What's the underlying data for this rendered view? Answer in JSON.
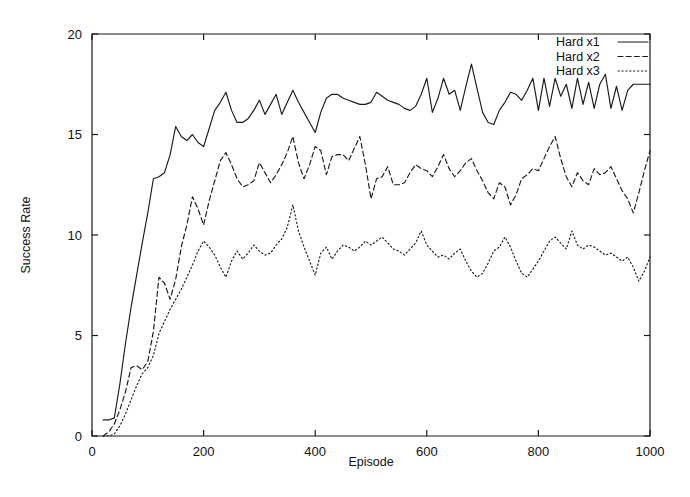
{
  "chart_data": {
    "type": "line",
    "title": "",
    "subtitle": "",
    "xlabel": "Episode",
    "ylabel": "Success Rate",
    "xlim": [
      0,
      1000
    ],
    "ylim": [
      0,
      20
    ],
    "xticks": [
      0,
      200,
      400,
      600,
      800,
      1000
    ],
    "yticks": [
      0,
      5,
      10,
      15,
      20
    ],
    "xtick_labels": [
      "0",
      "200",
      "400",
      "600",
      "800",
      "1000"
    ],
    "ytick_labels": [
      "0",
      "5",
      "10",
      "15",
      "20"
    ],
    "grid": false,
    "legend_position": "top-right",
    "legend_entries": [
      "Hard x1",
      "Hard x2",
      "Hard x3"
    ],
    "x": [
      20,
      30,
      40,
      50,
      60,
      70,
      80,
      90,
      100,
      110,
      120,
      130,
      140,
      150,
      160,
      170,
      180,
      190,
      200,
      210,
      220,
      230,
      240,
      250,
      260,
      270,
      280,
      290,
      300,
      310,
      320,
      330,
      340,
      350,
      360,
      370,
      380,
      390,
      400,
      410,
      420,
      430,
      440,
      450,
      460,
      470,
      480,
      490,
      500,
      510,
      520,
      530,
      540,
      550,
      560,
      570,
      580,
      590,
      600,
      610,
      620,
      630,
      640,
      650,
      660,
      670,
      680,
      690,
      700,
      710,
      720,
      730,
      740,
      750,
      760,
      770,
      780,
      790,
      800,
      810,
      820,
      830,
      840,
      850,
      860,
      870,
      880,
      890,
      900,
      910,
      920,
      930,
      940,
      950,
      960,
      970,
      980,
      990,
      1000
    ],
    "series": [
      {
        "name": "Hard x1",
        "style": "solid",
        "color": "#1a1a1a",
        "values": [
          0.8,
          0.8,
          0.9,
          2.6,
          4.6,
          6.4,
          8.0,
          9.6,
          11.1,
          12.8,
          12.9,
          13.1,
          14.0,
          15.4,
          14.9,
          14.7,
          15.0,
          14.6,
          14.4,
          15.3,
          16.2,
          16.6,
          17.1,
          16.2,
          15.6,
          15.6,
          15.8,
          16.2,
          16.7,
          16.0,
          16.5,
          17.0,
          16.0,
          16.6,
          17.2,
          16.6,
          16.1,
          15.6,
          15.1,
          16.1,
          16.8,
          17.0,
          17.0,
          16.8,
          16.7,
          16.6,
          16.5,
          16.5,
          16.6,
          17.1,
          16.9,
          16.7,
          16.6,
          16.5,
          16.3,
          16.2,
          16.4,
          17.0,
          17.8,
          16.1,
          16.8,
          17.8,
          17.0,
          17.2,
          16.2,
          17.4,
          18.5,
          17.3,
          16.1,
          15.6,
          15.5,
          16.2,
          16.6,
          17.1,
          17.0,
          16.7,
          17.2,
          17.8,
          16.2,
          17.8,
          16.4,
          17.8,
          16.9,
          17.5,
          16.3,
          17.8,
          16.5,
          17.6,
          16.3,
          17.5,
          18.0,
          16.3,
          17.4,
          16.2,
          17.2,
          17.5,
          17.5,
          17.5,
          17.5
        ]
      },
      {
        "name": "Hard x2",
        "style": "dashed",
        "color": "#1a1a1a",
        "values": [
          0.0,
          0.2,
          0.6,
          1.3,
          2.2,
          3.4,
          3.5,
          3.3,
          3.7,
          5.2,
          7.9,
          7.6,
          6.8,
          7.8,
          9.4,
          10.5,
          11.9,
          11.3,
          10.5,
          11.7,
          12.7,
          13.7,
          14.1,
          13.5,
          12.8,
          12.4,
          12.5,
          12.7,
          13.6,
          13.1,
          12.6,
          13.0,
          13.5,
          14.1,
          14.9,
          13.6,
          12.8,
          13.5,
          14.4,
          14.2,
          13.0,
          13.9,
          14.0,
          14.0,
          13.7,
          14.3,
          14.9,
          13.5,
          11.8,
          12.8,
          12.9,
          13.4,
          12.5,
          12.5,
          12.6,
          13.1,
          13.5,
          13.3,
          13.2,
          12.9,
          13.4,
          14.0,
          13.3,
          12.9,
          13.2,
          13.6,
          13.8,
          13.2,
          12.7,
          12.1,
          11.8,
          12.6,
          12.4,
          11.5,
          12.0,
          12.8,
          13.0,
          13.3,
          13.2,
          13.8,
          14.4,
          14.9,
          13.8,
          12.9,
          12.4,
          13.1,
          12.7,
          12.5,
          13.3,
          13.0,
          13.1,
          13.4,
          12.8,
          12.2,
          11.8,
          11.1,
          12.1,
          13.2,
          14.2
        ]
      },
      {
        "name": "Hard x3",
        "style": "dotted",
        "color": "#1a1a1a",
        "values": [
          0.0,
          0.0,
          0.1,
          0.5,
          1.1,
          1.8,
          2.5,
          3.1,
          3.4,
          4.0,
          5.1,
          5.7,
          6.3,
          6.8,
          7.3,
          7.9,
          8.5,
          9.2,
          9.7,
          9.4,
          9.0,
          8.4,
          7.9,
          8.7,
          9.2,
          8.8,
          9.1,
          9.5,
          9.2,
          9.0,
          9.1,
          9.5,
          9.8,
          10.4,
          11.5,
          10.2,
          9.4,
          8.7,
          8.0,
          9.1,
          9.4,
          8.8,
          9.2,
          9.5,
          9.4,
          9.2,
          9.4,
          9.7,
          9.5,
          9.7,
          9.9,
          9.6,
          9.3,
          9.2,
          9.0,
          9.3,
          9.6,
          10.2,
          9.5,
          9.2,
          8.9,
          9.0,
          8.8,
          9.1,
          9.3,
          8.7,
          8.2,
          7.9,
          8.1,
          8.6,
          9.2,
          9.4,
          9.9,
          9.4,
          8.7,
          8.1,
          7.9,
          8.3,
          8.7,
          9.2,
          9.7,
          9.9,
          9.6,
          9.3,
          10.2,
          9.5,
          9.3,
          9.5,
          9.4,
          9.2,
          9.0,
          9.1,
          8.9,
          8.7,
          8.9,
          8.4,
          7.7,
          8.2,
          8.9
        ]
      }
    ]
  }
}
